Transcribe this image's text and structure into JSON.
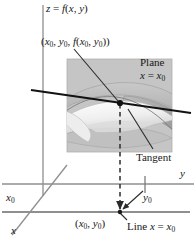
{
  "figure": {
    "width": 196,
    "height": 244,
    "background": "#ffffff"
  },
  "labels": {
    "surface_equation": "z = f(x, y)",
    "point_3d": "(x0, y0, f(x0, y0))",
    "plane_word": "Plane",
    "plane_equation": "x = x0",
    "tangent": "Tangent",
    "y_axis": "y",
    "x_axis": "x",
    "y0_tick": "y0",
    "x0_tick": "x0",
    "point_2d": "(x0, y0)",
    "line_equation": "Line x = x0"
  },
  "colors": {
    "axis_gray": "#8f8f8f",
    "ink_black": "#141414",
    "plane_fill": "#c3c3c3",
    "plane_edge": "#b4b4b4",
    "surface_light": "#f2f2f2",
    "surface_mid": "#d6d6d6",
    "surface_dark": "#a9a9a9",
    "background": "#ffffff"
  },
  "geometry": {
    "z_axis": {
      "x": 43,
      "y_top": 5,
      "y_bottom": 196
    },
    "y_axis": {
      "y": 184,
      "x_left": 2,
      "x_right": 194
    },
    "x_axis": {
      "x1": 12,
      "y1": 235,
      "x2": 67,
      "y2": 165
    },
    "base_line": {
      "y": 212,
      "x_left": 2,
      "x_right": 190
    },
    "plane_rect": {
      "x": 67,
      "y": 59,
      "w": 105,
      "h": 93
    },
    "tangent_line": {
      "x1": 31,
      "y1": 90,
      "x2": 191,
      "y2": 113
    },
    "tangency_point": {
      "x": 120,
      "y": 103
    },
    "foot_point": {
      "x": 120,
      "y": 212
    },
    "dashed_drop": {
      "x": 120,
      "y_top": 103,
      "y_bottom": 212
    },
    "y0_tick_mark": {
      "x": 145,
      "y_top": 176,
      "y_bottom": 192
    }
  },
  "leaders": {
    "point_3d_to_point": {
      "x1": 75,
      "y1": 50,
      "x2": 119,
      "y2": 102
    },
    "tangent_to_curve": {
      "x1": 152,
      "y1": 148,
      "x2": 129,
      "y2": 110
    },
    "line_eq_to_foot": {
      "x1": 126,
      "y1": 219,
      "x2": 119,
      "y2": 212
    },
    "y0_to_foot": {
      "x1": 142,
      "y1": 192,
      "x2": 121,
      "y2": 210
    }
  }
}
